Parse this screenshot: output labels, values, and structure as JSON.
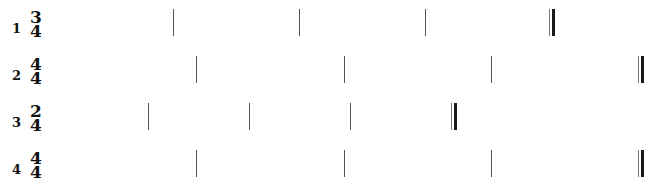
{
  "systems": [
    {
      "number": "1",
      "time_signature": {
        "numerator": "3",
        "denominator": "4"
      },
      "top": 5,
      "barlines_x": [
        173,
        299,
        425
      ],
      "final_barline_x": 549
    },
    {
      "number": "2",
      "time_signature": {
        "numerator": "4",
        "denominator": "4"
      },
      "top": 52,
      "barlines_x": [
        196,
        344,
        491
      ],
      "final_barline_x": 638
    },
    {
      "number": "3",
      "time_signature": {
        "numerator": "2",
        "denominator": "4"
      },
      "top": 99,
      "barlines_x": [
        148,
        249,
        350
      ],
      "final_barline_x": 451
    },
    {
      "number": "4",
      "time_signature": {
        "numerator": "4",
        "denominator": "4"
      },
      "top": 146,
      "barlines_x": [
        196,
        344,
        491
      ],
      "final_barline_x": 638
    }
  ]
}
